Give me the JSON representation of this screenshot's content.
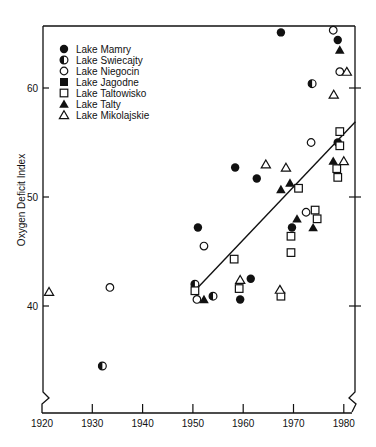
{
  "chart_data": {
    "type": "scatter",
    "title": "",
    "xlabel": "",
    "ylabel": "Oxygen Deficit Index",
    "xlim": [
      1920,
      1980
    ],
    "ylim": [
      40,
      60
    ],
    "x_ticks": [
      1920,
      1930,
      1940,
      1950,
      1960,
      1970,
      1980
    ],
    "y_ticks": [
      40,
      50,
      60
    ],
    "grid": false,
    "legend_position": "upper-left",
    "axis_breaks": [
      "x-axis near origin (left)",
      "right frame near bottom"
    ],
    "series": [
      {
        "name": "Lake Mamry",
        "marker": "filled-circle",
        "points": [
          [
            1967.5,
            65.1
          ],
          [
            1978.8,
            64.4
          ],
          [
            1958.4,
            52.7
          ],
          [
            1962.7,
            51.7
          ],
          [
            1951.0,
            47.2
          ],
          [
            1961.5,
            42.5
          ],
          [
            1959.4,
            40.6
          ],
          [
            1969.7,
            47.2
          ],
          [
            1978.8,
            55.0
          ]
        ]
      },
      {
        "name": "Lake Swiecajty",
        "marker": "half-filled-circle",
        "points": [
          [
            1932.0,
            34.5
          ],
          [
            1973.7,
            60.4
          ],
          [
            1950.4,
            42.0
          ],
          [
            1954.0,
            40.9
          ]
        ]
      },
      {
        "name": "Lake Niegocin",
        "marker": "open-circle",
        "points": [
          [
            1933.5,
            41.7
          ],
          [
            1952.2,
            45.5
          ],
          [
            1950.8,
            40.6
          ],
          [
            1972.5,
            48.6
          ],
          [
            1973.5,
            55.0
          ],
          [
            1977.9,
            65.3
          ],
          [
            1979.2,
            61.5
          ]
        ]
      },
      {
        "name": "Lake Jagodne",
        "marker": "filled-square",
        "points": []
      },
      {
        "name": "Lake Taltowisko",
        "marker": "open-square",
        "points": [
          [
            1950.4,
            41.4
          ],
          [
            1958.2,
            44.3
          ],
          [
            1959.2,
            41.6
          ],
          [
            1967.5,
            40.9
          ],
          [
            1969.5,
            46.4
          ],
          [
            1969.5,
            44.9
          ],
          [
            1971.0,
            50.8
          ],
          [
            1974.3,
            48.8
          ],
          [
            1974.7,
            48.0
          ],
          [
            1979.2,
            56.0
          ],
          [
            1979.2,
            54.7
          ],
          [
            1978.6,
            52.6
          ],
          [
            1978.8,
            51.8
          ]
        ]
      },
      {
        "name": "Lake Talty",
        "marker": "filled-triangle",
        "points": [
          [
            1952.2,
            40.6
          ],
          [
            1967.5,
            50.7
          ],
          [
            1969.3,
            51.3
          ],
          [
            1970.7,
            48.0
          ],
          [
            1973.9,
            47.2
          ],
          [
            1977.9,
            53.3
          ],
          [
            1979.2,
            63.5
          ]
        ]
      },
      {
        "name": "Lake Mikolajskie",
        "marker": "open-triangle",
        "points": [
          [
            1921.4,
            41.3
          ],
          [
            1964.5,
            53.0
          ],
          [
            1968.5,
            52.7
          ],
          [
            1959.4,
            42.4
          ],
          [
            1967.3,
            41.5
          ],
          [
            1978.0,
            59.4
          ],
          [
            1980.0,
            53.3
          ],
          [
            1980.6,
            61.5
          ]
        ]
      }
    ],
    "regression_line": {
      "from": [
        1951.0,
        41.7
      ],
      "to": [
        1982.3,
        56.9
      ]
    }
  },
  "legend": {
    "items": [
      {
        "label": "Lake Mamry",
        "marker": "filled-circle"
      },
      {
        "label": "Lake Swiecajty",
        "marker": "half-filled-circle"
      },
      {
        "label": "Lake Niegocin",
        "marker": "open-circle"
      },
      {
        "label": "Lake Jagodne",
        "marker": "filled-square"
      },
      {
        "label": "Lake Taltowisko",
        "marker": "open-square"
      },
      {
        "label": "Lake Talty",
        "marker": "filled-triangle"
      },
      {
        "label": "Lake Mikolajskie",
        "marker": "open-triangle"
      }
    ]
  },
  "axes": {
    "y_title": "Oxygen Deficit Index",
    "x_tick_labels": [
      "1920",
      "1930",
      "1940",
      "1950",
      "1960",
      "1970",
      "1980"
    ],
    "y_tick_labels": [
      "40",
      "50",
      "60"
    ]
  },
  "colors": {
    "ink": "#111111",
    "background": "#ffffff"
  }
}
